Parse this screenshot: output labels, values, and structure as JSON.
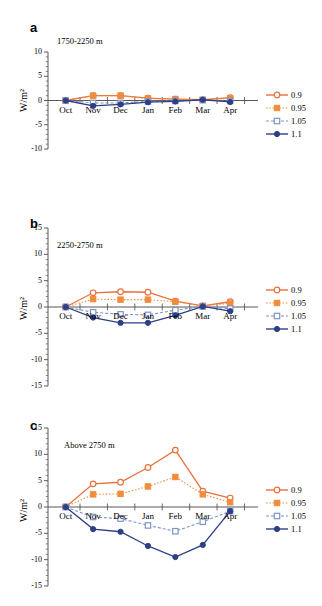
{
  "figure": {
    "ylabel": "W/m²",
    "xticks": [
      "Oct",
      "Nov",
      "Dec",
      "Jan",
      "Feb",
      "Mar",
      "Apr"
    ],
    "colors": {
      "orange": "#E8713A",
      "orange_fill": "#F08C3C",
      "blue_light": "#7E94C4",
      "blue_dark": "#2D3F87",
      "axis": "#595959"
    },
    "legend_position": "right"
  },
  "panels": [
    {
      "letter": "a",
      "title": "1750-2250 m",
      "yticks": [
        "10",
        "5",
        "0",
        "-5",
        "-10"
      ]
    },
    {
      "letter": "b",
      "title": "2250-2750 m",
      "yticks": [
        "15",
        "10",
        "5",
        "0",
        "-5",
        "-10",
        "-15"
      ]
    },
    {
      "letter": "c",
      "title": "Above 2750 m",
      "yticks": [
        "15",
        "10",
        "5",
        "0",
        "-5",
        "-10",
        "-15"
      ]
    }
  ],
  "legend": [
    {
      "label": "0.9",
      "color": "#E8713A",
      "marker": "open-circle",
      "dash": "none"
    },
    {
      "label": "0.95",
      "color": "#F08C3C",
      "marker": "filled-square",
      "dash": "dotted"
    },
    {
      "label": "1.05",
      "color": "#7E94C4",
      "marker": "open-square",
      "dash": "dashed"
    },
    {
      "label": "1.1",
      "color": "#2D3F87",
      "marker": "filled-circle",
      "dash": "none"
    }
  ],
  "chart_data": [
    {
      "type": "line",
      "panel": "a",
      "title": "1750-2250 m",
      "xlabel": "",
      "ylabel": "W/m²",
      "x": [
        "Oct",
        "Nov",
        "Dec",
        "Jan",
        "Feb",
        "Mar",
        "Apr"
      ],
      "ylim": [
        -10,
        10
      ],
      "yticks": [
        -10,
        -5,
        0,
        5,
        10
      ],
      "grid": false,
      "series": [
        {
          "name": "0.9",
          "values": [
            0.0,
            1.0,
            1.0,
            0.5,
            0.3,
            0.15,
            0.6
          ]
        },
        {
          "name": "0.95",
          "values": [
            0.0,
            1.0,
            1.0,
            0.4,
            0.3,
            0.1,
            0.45
          ]
        },
        {
          "name": "1.05",
          "values": [
            0.0,
            -0.5,
            -0.5,
            -0.2,
            -0.1,
            0.1,
            -0.1
          ]
        },
        {
          "name": "1.1",
          "values": [
            0.0,
            -1.1,
            -0.8,
            -0.35,
            -0.2,
            0.15,
            -0.3
          ]
        }
      ]
    },
    {
      "type": "line",
      "panel": "b",
      "title": "2250-2750 m",
      "xlabel": "",
      "ylabel": "W/m²",
      "x": [
        "Oct",
        "Nov",
        "Dec",
        "Jan",
        "Feb",
        "Mar",
        "Apr"
      ],
      "ylim": [
        -15,
        15
      ],
      "yticks": [
        -15,
        -10,
        -5,
        0,
        5,
        10,
        15
      ],
      "grid": false,
      "series": [
        {
          "name": "0.9",
          "values": [
            0.0,
            2.7,
            2.9,
            2.8,
            1.1,
            0.2,
            1.0
          ]
        },
        {
          "name": "0.95",
          "values": [
            0.0,
            1.5,
            1.4,
            1.4,
            1.0,
            0.2,
            0.7
          ]
        },
        {
          "name": "1.05",
          "values": [
            0.0,
            -1.0,
            -1.4,
            -1.5,
            -0.6,
            0.1,
            -0.3
          ]
        },
        {
          "name": "1.1",
          "values": [
            0.0,
            -2.0,
            -3.0,
            -3.0,
            -1.6,
            0.1,
            -0.8
          ]
        }
      ]
    },
    {
      "type": "line",
      "panel": "c",
      "title": "Above 2750 m",
      "xlabel": "",
      "ylabel": "W/m²",
      "x": [
        "Oct",
        "Nov",
        "Dec",
        "Jan",
        "Feb",
        "Mar",
        "Apr"
      ],
      "ylim": [
        -15,
        15
      ],
      "yticks": [
        -15,
        -10,
        -5,
        0,
        5,
        10,
        15
      ],
      "grid": false,
      "series": [
        {
          "name": "0.9",
          "values": [
            0.0,
            4.4,
            4.7,
            7.5,
            10.8,
            3.0,
            1.7
          ]
        },
        {
          "name": "0.95",
          "values": [
            0.0,
            2.4,
            2.5,
            3.9,
            5.7,
            2.4,
            0.9
          ]
        },
        {
          "name": "1.05",
          "values": [
            0.0,
            -1.9,
            -2.2,
            -3.5,
            -4.6,
            -2.8,
            -0.8
          ]
        },
        {
          "name": "1.1",
          "values": [
            0.0,
            -4.2,
            -4.7,
            -7.4,
            -9.5,
            -7.2,
            -0.8
          ]
        }
      ]
    }
  ]
}
